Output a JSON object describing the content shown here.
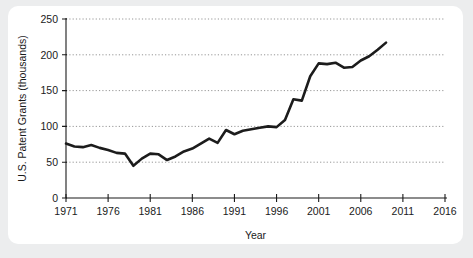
{
  "figure": {
    "background_color": "#ecedee",
    "panel_color": "#ffffff",
    "line_color": "#1c1c1c",
    "grid_color": "#8a8a8a",
    "axis_color": "#1a1a1a"
  },
  "chart_data": {
    "type": "line",
    "title": "",
    "xlabel": "Year",
    "ylabel": "U.S. Patent Grants (thousands)",
    "xlim": [
      1971,
      2016
    ],
    "ylim": [
      0,
      250
    ],
    "xticks": [
      1971,
      1976,
      1981,
      1986,
      1991,
      1996,
      2001,
      2006,
      2011,
      2016
    ],
    "xtick_labels": [
      "1971",
      "1976",
      "1981",
      "1986",
      "1991",
      "1996",
      "2001",
      "2006",
      "2011",
      "2016"
    ],
    "yticks": [
      0,
      50,
      100,
      150,
      200,
      250
    ],
    "ytick_labels": [
      "0",
      "50",
      "100",
      "150",
      "200",
      "250"
    ],
    "grid": "horizontal-dotted",
    "legend": "none",
    "series": [
      {
        "name": "U.S. Patent Grants",
        "x": [
          1971,
          1972,
          1973,
          1974,
          1975,
          1976,
          1977,
          1978,
          1979,
          1980,
          1981,
          1982,
          1983,
          1984,
          1985,
          1986,
          1987,
          1988,
          1989,
          1990,
          1991,
          1992,
          1993,
          1994,
          1995,
          1996,
          1997,
          1998,
          1999,
          2000,
          2001,
          2002,
          2003,
          2004,
          2005,
          2006,
          2007,
          2008,
          2009
        ],
        "values": [
          76,
          72,
          71,
          74,
          70,
          67,
          63,
          62,
          45,
          55,
          62,
          61,
          53,
          58,
          65,
          69,
          76,
          83,
          77,
          95,
          89,
          94,
          96,
          98,
          100,
          99,
          109,
          138,
          136,
          170,
          188,
          187,
          189,
          182,
          183,
          192,
          198,
          207,
          217
        ]
      }
    ]
  },
  "axes": {
    "y_axis_title": "U.S. Patent Grants (thousands)",
    "x_axis_title": "Year"
  }
}
